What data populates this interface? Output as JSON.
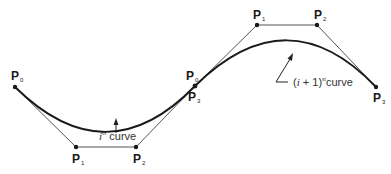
{
  "diagram": {
    "type": "piecewise-cubic-bezier",
    "colors": {
      "curve": "#1a1a1a",
      "polygon": "#555555",
      "point": "#1a1a1a",
      "text": "#222222"
    },
    "segment_i": {
      "caption_var": "i",
      "caption_sup": "th",
      "caption_word": "curve",
      "points": [
        {
          "label": "P",
          "sub": "0",
          "x": 15,
          "y": 87
        },
        {
          "label": "P",
          "sub": "1",
          "x": 76,
          "y": 147
        },
        {
          "label": "P",
          "sub": "2",
          "x": 136,
          "y": 147
        },
        {
          "label": "P",
          "sub": "3",
          "x": 195,
          "y": 86
        }
      ]
    },
    "segment_i1": {
      "caption_open": "(",
      "caption_var": "i",
      "caption_plus": " + 1)",
      "caption_sup": "st",
      "caption_word": "curve",
      "points": [
        {
          "label": "P",
          "sub": "0",
          "x": 195,
          "y": 86
        },
        {
          "label": "P",
          "sub": "1",
          "x": 257,
          "y": 25
        },
        {
          "label": "P",
          "sub": "2",
          "x": 317,
          "y": 25
        },
        {
          "label": "P",
          "sub": "3",
          "x": 376,
          "y": 87
        }
      ]
    }
  }
}
